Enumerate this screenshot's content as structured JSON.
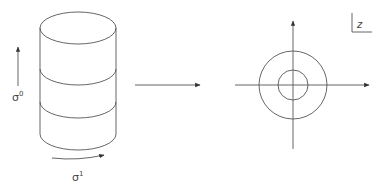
{
  "diagram": {
    "cylinder": {
      "label_vertical": "σ",
      "label_vertical_sup": "0",
      "label_horizontal": "σ",
      "label_horizontal_sup": "1"
    },
    "map_arrow": "→",
    "plane": {
      "corner_label": "z"
    },
    "colors": {
      "stroke": "#555555",
      "background": "#ffffff"
    }
  }
}
